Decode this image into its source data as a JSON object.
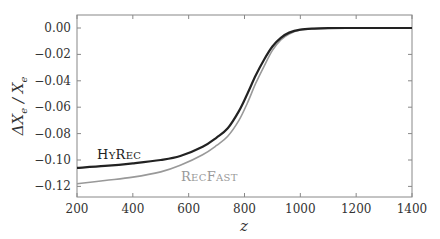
{
  "chart_data": {
    "type": "line",
    "title": "",
    "xlabel": "z",
    "ylabel": "ΔX_e / X_e",
    "xlim": [
      200,
      1400
    ],
    "ylim": [
      -0.13,
      0.01
    ],
    "grid": false,
    "legend": "inline labels",
    "x_ticks": [
      200,
      400,
      600,
      800,
      1000,
      1200,
      1400
    ],
    "x_tick_labels": [
      "200",
      "400",
      "600",
      "800",
      "1000",
      "1200",
      "1400"
    ],
    "y_ticks": [
      0.0,
      -0.02,
      -0.04,
      -0.06,
      -0.08,
      -0.1,
      -0.12
    ],
    "y_tick_labels": [
      "0.00",
      "−0.02",
      "−0.04",
      "−0.06",
      "−0.08",
      "−0.10",
      "−0.12"
    ],
    "x": [
      200,
      300,
      400,
      500,
      570,
      650,
      700,
      740,
      780,
      810,
      840,
      870,
      900,
      930,
      960,
      1000,
      1050,
      1100,
      1200,
      1300,
      1400
    ],
    "series": [
      {
        "name": "HyRec",
        "color": "#222222",
        "values": [
          -0.106,
          -0.1045,
          -0.1025,
          -0.1,
          -0.097,
          -0.09,
          -0.083,
          -0.076,
          -0.063,
          -0.05,
          -0.036,
          -0.024,
          -0.014,
          -0.0075,
          -0.0035,
          -0.0012,
          -0.0004,
          -0.0001,
          0.0,
          0.0,
          0.0
        ]
      },
      {
        "name": "RecFast",
        "color": "#999999",
        "values": [
          -0.118,
          -0.1155,
          -0.113,
          -0.109,
          -0.104,
          -0.096,
          -0.089,
          -0.082,
          -0.07,
          -0.057,
          -0.042,
          -0.029,
          -0.017,
          -0.009,
          -0.0045,
          -0.0015,
          -0.0005,
          -0.0001,
          0.0,
          0.0,
          0.0
        ]
      }
    ],
    "annotations": [
      {
        "text": "HyRec",
        "x": 280,
        "y": -0.098
      },
      {
        "text": "RecFast",
        "x": 640,
        "y": -0.12
      }
    ]
  }
}
